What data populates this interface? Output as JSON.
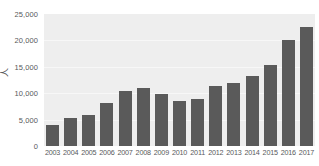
{
  "chart_data": {
    "type": "bar",
    "title": "",
    "subtitle": "",
    "xlabel": "",
    "ylabel": "人",
    "categories": [
      "2003",
      "2004",
      "2005",
      "2006",
      "2007",
      "2008",
      "2009",
      "2010",
      "2011",
      "2012",
      "2013",
      "2014",
      "2015",
      "2016",
      "2017"
    ],
    "values": [
      4000,
      5400,
      5800,
      8200,
      10500,
      10900,
      9800,
      8500,
      8900,
      11400,
      11900,
      13200,
      15300,
      20000,
      22600
    ],
    "ylim": [
      0,
      25000
    ],
    "yticks": [
      0,
      5000,
      10000,
      15000,
      20000,
      25000
    ],
    "ytick_labels": [
      "0",
      "5,000",
      "10,000",
      "15,000",
      "20,000",
      "25,000"
    ],
    "grid": true,
    "legend": "none",
    "series": [
      {
        "name": "",
        "values": [
          4000,
          5400,
          5800,
          8200,
          10500,
          10900,
          9800,
          8500,
          8900,
          11400,
          11900,
          13200,
          15300,
          20000,
          22600
        ]
      }
    ],
    "colors": {
      "bar": "#5a5a5a",
      "plot_background": "#eeeeee",
      "gridline": "#f7f7f7",
      "text": "#58595b",
      "page_background": "#ffffff"
    }
  }
}
